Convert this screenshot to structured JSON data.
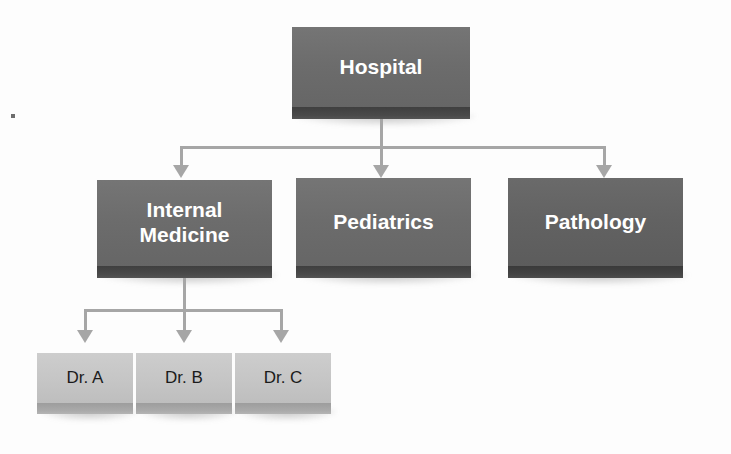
{
  "diagram": {
    "background_color": "#fdfdfd",
    "connector_color": "#a6a6a6",
    "levels": 3
  },
  "nodes": {
    "root": {
      "label": "Hospital",
      "style": "dark",
      "fill_color": "#6e6e6e",
      "text_color": "#ffffff",
      "x": 292,
      "y": 27,
      "width": 178,
      "height": 80,
      "slab_height": 12
    },
    "internal_medicine": {
      "label_line1": "Internal",
      "label_line2": "Medicine",
      "style": "dark",
      "fill_color": "#6e6e6e",
      "text_color": "#ffffff",
      "x": 97,
      "y": 180,
      "width": 175,
      "height": 86,
      "slab_height": 12
    },
    "pediatrics": {
      "label": "Pediatrics",
      "style": "dark",
      "fill_color": "#6e6e6e",
      "text_color": "#ffffff",
      "x": 296,
      "y": 178,
      "width": 175,
      "height": 88,
      "slab_height": 12
    },
    "pathology": {
      "label": "Pathology",
      "style": "darker",
      "fill_color": "#636363",
      "text_color": "#ffffff",
      "x": 508,
      "y": 178,
      "width": 175,
      "height": 88,
      "slab_height": 12
    },
    "doctor_a": {
      "label": "Dr. A",
      "style": "light",
      "fill_color": "#c6c6c6",
      "text_color": "#1b1b1b",
      "x": 37,
      "y": 353,
      "width": 96,
      "height": 50,
      "slab_height": 11
    },
    "doctor_b": {
      "label": "Dr. B",
      "style": "light",
      "fill_color": "#c6c6c6",
      "text_color": "#1b1b1b",
      "x": 136,
      "y": 353,
      "width": 96,
      "height": 50,
      "slab_height": 11
    },
    "doctor_c": {
      "label": "Dr. C",
      "style": "light",
      "fill_color": "#c6c6c6",
      "text_color": "#1b1b1b",
      "x": 235,
      "y": 353,
      "width": 96,
      "height": 50,
      "slab_height": 11
    }
  },
  "edges": [
    {
      "from": "root",
      "to": "internal_medicine",
      "arrow": true
    },
    {
      "from": "root",
      "to": "pediatrics",
      "arrow": true
    },
    {
      "from": "root",
      "to": "pathology",
      "arrow": true
    },
    {
      "from": "internal_medicine",
      "to": "doctor_a",
      "arrow": true
    },
    {
      "from": "internal_medicine",
      "to": "doctor_b",
      "arrow": true
    },
    {
      "from": "internal_medicine",
      "to": "doctor_c",
      "arrow": true
    }
  ],
  "hierarchy": {
    "Hospital": {
      "Internal Medicine": [
        "Dr. A",
        "Dr. B",
        "Dr. C"
      ],
      "Pediatrics": [],
      "Pathology": []
    }
  }
}
